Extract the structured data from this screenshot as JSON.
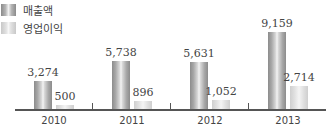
{
  "chart_data": {
    "type": "bar",
    "title": "",
    "xlabel": "",
    "ylabel": "",
    "categories": [
      "2010",
      "2011",
      "2012",
      "2013"
    ],
    "series": [
      {
        "name": "매출액",
        "values": [
          3274,
          5738,
          5631,
          9159
        ],
        "labels": [
          "3,274",
          "5,738",
          "5,631",
          "9,159"
        ]
      },
      {
        "name": "영업이익",
        "values": [
          500,
          896,
          1052,
          2714
        ],
        "labels": [
          "500",
          "896",
          "1,052",
          "2,714"
        ]
      }
    ],
    "legend_position": "top-left",
    "grid": false,
    "ylim": [
      0,
      10000
    ]
  },
  "legend": {
    "items": [
      {
        "label": "매출액"
      },
      {
        "label": "영업이익"
      }
    ]
  }
}
